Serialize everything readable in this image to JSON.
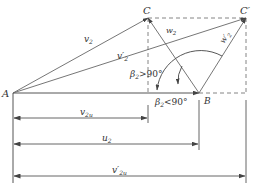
{
  "diagram": {
    "colors": {
      "line": "#555555",
      "text": "#333333",
      "background": "#ffffff"
    },
    "points": {
      "A": {
        "label": "A",
        "x": 13,
        "y": 93
      },
      "B": {
        "label": "B",
        "x": 199,
        "y": 93
      },
      "C": {
        "label": "C",
        "x": 148,
        "y": 18
      },
      "C_prime": {
        "label": "C′",
        "x": 246,
        "y": 18
      }
    },
    "vectors": {
      "v2": {
        "label": "v",
        "sub": "2",
        "from": "A",
        "to": "C"
      },
      "v2_prime": {
        "label": "v′",
        "sub": "2",
        "from": "A",
        "to": "C_prime"
      },
      "w2": {
        "label": "w",
        "sub": "2",
        "from": "B",
        "to": "C"
      },
      "w2_prime": {
        "label": "w′",
        "sub": "2",
        "from": "B",
        "to": "C_prime"
      }
    },
    "angles": {
      "obtuse": {
        "label": "β",
        "sub": "2",
        "relation": ">90°"
      },
      "acute": {
        "label": "β",
        "sub": "2",
        "relation": "<90°"
      }
    },
    "dimensions": [
      {
        "id": "v2u",
        "label": "v",
        "sub": "2u",
        "from_x": 13,
        "to_x": 148,
        "y": 118
      },
      {
        "id": "u2",
        "label": "u",
        "sub": "2",
        "from_x": 13,
        "to_x": 199,
        "y": 144
      },
      {
        "id": "v2u_prime",
        "label": "v′",
        "sub": "2u",
        "from_x": 13,
        "to_x": 246,
        "y": 176
      }
    ]
  }
}
